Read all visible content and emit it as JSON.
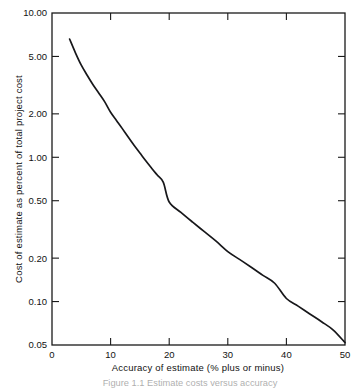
{
  "figure": {
    "caption": "Figure 1.1   Estimate costs versus accuracy",
    "caption_visible_fragment": "Estimate cost versus accuracy of cost estimating"
  },
  "chart_data": {
    "type": "line",
    "title": "",
    "xlabel": "Accuracy of estimate (% plus or minus)",
    "ylabel": "Cost of estimate as percent of total project cost",
    "xscale": "linear",
    "yscale": "log",
    "xlim": [
      0,
      50
    ],
    "ylim": [
      0.05,
      10.0
    ],
    "grid": false,
    "legend": null,
    "x_ticks": [
      0,
      10,
      20,
      30,
      40,
      50
    ],
    "x_tick_labels": [
      "0",
      "10",
      "20",
      "30",
      "40",
      "50"
    ],
    "y_ticks": [
      10.0,
      5.0,
      2.0,
      1.0,
      0.5,
      0.2,
      0.1,
      0.05
    ],
    "y_tick_labels": [
      "10.00",
      "5.00",
      "2.00",
      "1.00",
      "0.50",
      "0.20",
      "0.10",
      "0.05"
    ],
    "series": [
      {
        "name": "Cost of estimate",
        "color": "#17171a",
        "x": [
          3.0,
          4.0,
          5.0,
          6.0,
          7.0,
          8.0,
          9.0,
          10.0,
          11.0,
          12.0,
          13.0,
          14.0,
          15.0,
          16.0,
          17.0,
          18.0,
          19.0,
          20.0,
          22.0,
          24.0,
          26.0,
          28.0,
          30.0,
          32.0,
          34.0,
          36.0,
          38.0,
          40.0,
          42.0,
          44.0,
          46.0,
          48.0,
          50.0
        ],
        "y": [
          6.6,
          5.3,
          4.35,
          3.7,
          3.18,
          2.78,
          2.42,
          2.05,
          1.8,
          1.58,
          1.38,
          1.21,
          1.07,
          0.945,
          0.84,
          0.75,
          0.67,
          0.49,
          0.415,
          0.355,
          0.305,
          0.262,
          0.222,
          0.196,
          0.173,
          0.152,
          0.134,
          0.105,
          0.093,
          0.082,
          0.0725,
          0.0635,
          0.052
        ]
      }
    ],
    "annotations": []
  }
}
